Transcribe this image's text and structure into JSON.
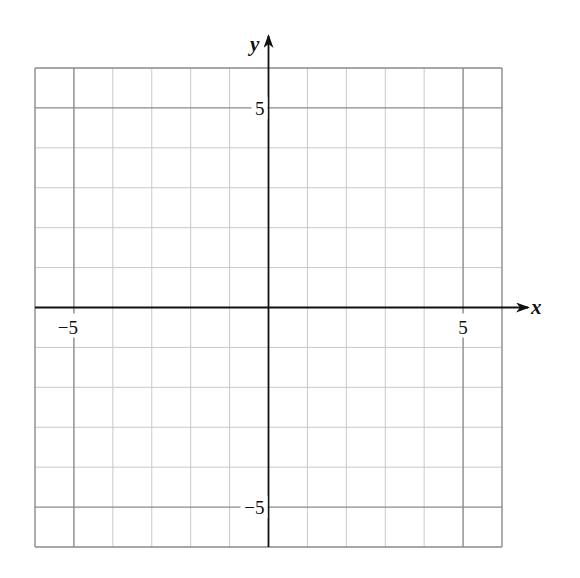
{
  "chart_data": {
    "type": "scatter",
    "title": "",
    "xlabel": "x",
    "ylabel": "y",
    "xlim": [
      -6,
      6
    ],
    "ylim": [
      -6,
      6
    ],
    "grid": true,
    "grid_step": 1,
    "major_grid_step": 5,
    "x_ticks": [
      {
        "value": -5,
        "label": "−5"
      },
      {
        "value": 5,
        "label": "5"
      }
    ],
    "y_ticks": [
      {
        "value": 5,
        "label": "5"
      },
      {
        "value": -5,
        "label": "−5"
      }
    ],
    "series": []
  },
  "colors": {
    "axis": "#111111",
    "major_grid": "#8a8a8a",
    "minor_grid": "#c8c8c8",
    "background": "#ffffff"
  }
}
